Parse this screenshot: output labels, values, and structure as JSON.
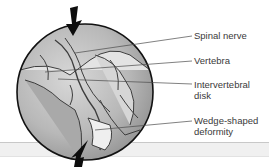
{
  "figure": {
    "labels": [
      {
        "text": "Spinal nerve"
      },
      {
        "text": "Vertebra"
      },
      {
        "text": "Intervertebral\ndisk"
      },
      {
        "text": "Wedge-shaped\ndeformity"
      }
    ],
    "arrows": [
      {
        "name": "top-compression-arrow",
        "direction": "down"
      },
      {
        "name": "bottom-compression-arrow",
        "direction": "up"
      }
    ],
    "colors": {
      "circle_border": "#111111",
      "leader_line": "#4a4a4a",
      "label_text": "#3a3a3a",
      "arrow": "#0d0d0d"
    }
  }
}
